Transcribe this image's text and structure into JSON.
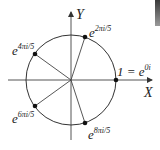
{
  "diagram": {
    "type": "unit-circle-roots-of-unity",
    "axes": {
      "x_label": "X",
      "y_label": "Y"
    },
    "points": [
      {
        "base": "1 = e",
        "exponent": "0i",
        "angle_deg": 0
      },
      {
        "base": "e",
        "exponent": "2πi/5",
        "angle_deg": 72
      },
      {
        "base": "e",
        "exponent": "4πi/5",
        "angle_deg": 144
      },
      {
        "base": "e",
        "exponent": "6πi/5",
        "angle_deg": 216
      },
      {
        "base": "e",
        "exponent": "8πi/5",
        "angle_deg": 288
      }
    ],
    "colors": {
      "stroke": "#333333",
      "point": "#111111"
    }
  }
}
